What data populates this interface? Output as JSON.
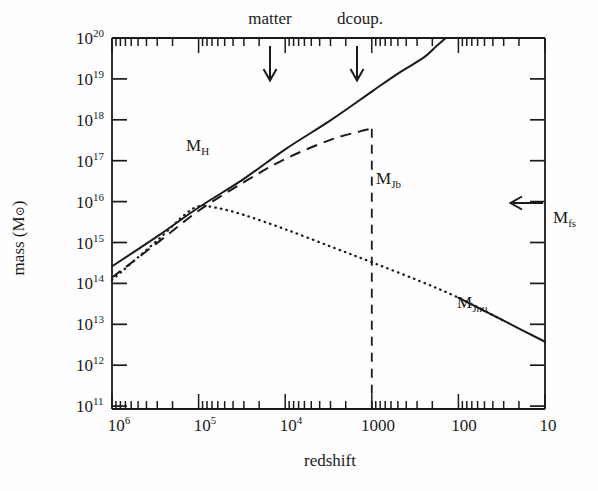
{
  "figure": {
    "kind": "log-log line plot",
    "background_color": "#fefefe",
    "ink_color": "#1a1a1a"
  },
  "chart_data": {
    "type": "line",
    "title": "",
    "xlabel": "redshift",
    "ylabel": "mass (M⊙)",
    "x_scale": "log-reversed",
    "y_scale": "log",
    "xlim": [
      1000000,
      10
    ],
    "ylim": [
      10000000000.0,
      1e+20
    ],
    "grid": false,
    "legend": "inline-annotations",
    "x_tick_labels": [
      "10⁶",
      "10⁵",
      "10⁴",
      "1000",
      "100",
      "10"
    ],
    "x_tick_values": [
      1000000,
      100000,
      10000,
      1000,
      100,
      10
    ],
    "y_tick_labels": [
      "10²⁰",
      "10¹⁹",
      "10¹⁸",
      "10¹⁷",
      "10¹⁶",
      "10¹⁵",
      "10¹⁴",
      "10¹³",
      "10¹²",
      "10¹¹"
    ],
    "y_tick_values": [
      1e+20,
      1e+19,
      1e+18,
      1e+17,
      1e+16,
      1000000000000000.0,
      100000000000000.0,
      10000000000000.0,
      1000000000000.0,
      100000000000.0
    ],
    "series": [
      {
        "name": "M_H",
        "label": "M",
        "sub": "H",
        "style": "solid",
        "description": "Horizon mass; rises monotonically toward low redshift",
        "points": [
          [
            1000000,
            70000000000000.0
          ],
          [
            300000,
            450000000000000.0
          ],
          [
            100000,
            2700000000000000.0
          ],
          [
            30000,
            1.6e+16
          ],
          [
            10000,
            1e+17
          ],
          [
            3000,
            6e+17
          ],
          [
            1000,
            3.6e+18
          ],
          [
            500,
            1.1e+19
          ],
          [
            250,
            3e+19
          ],
          [
            180,
            6e+19
          ],
          [
            140,
            1e+20
          ]
        ]
      },
      {
        "name": "M_Jb",
        "label": "M",
        "sub": "Jb",
        "style": "dashed",
        "description": "Baryon Jeans mass; tracks M_H then flattens and drops vertically at decoupling",
        "points": [
          [
            1000000,
            35000000000000.0
          ],
          [
            300000,
            300000000000000.0
          ],
          [
            100000,
            2200000000000000.0
          ],
          [
            30000,
            1.3e+16
          ],
          [
            10000,
            5.5e+16
          ],
          [
            3000,
            1.8e+17
          ],
          [
            1400,
            3e+17
          ],
          [
            1000,
            3.6e+17
          ]
        ],
        "vertical_drop_at_redshift": 1000
      },
      {
        "name": "M_Jnu",
        "label": "M",
        "sub": "Jnu",
        "style": "dotted-then-solid",
        "description": "Neutrino Jeans mass; peaks near z=1e5 at ~3e15 then declines",
        "points": [
          [
            1000000,
            30000000000000.0
          ],
          [
            300000,
            350000000000000.0
          ],
          [
            150000,
            1600000000000000.0
          ],
          [
            100000,
            2900000000000000.0
          ],
          [
            60000,
            2600000000000000.0
          ],
          [
            30000,
            1700000000000000.0
          ],
          [
            10000,
            700000000000000.0
          ],
          [
            3000,
            240000000000000.0
          ],
          [
            1000,
            90000000000000.0
          ],
          [
            300,
            30000000000000.0
          ],
          [
            100,
            10000000000000.0
          ],
          [
            30,
            2400000000000.0
          ],
          [
            10,
            650000000000.0
          ]
        ]
      }
    ],
    "annotations": [
      {
        "name": "matter",
        "text": "matter",
        "type": "top-arrow",
        "redshift": 6000
      },
      {
        "name": "dcoup",
        "text": "dcoup.",
        "type": "top-arrow",
        "redshift": 1000
      },
      {
        "name": "mfs",
        "text": "M",
        "sub": "fs",
        "type": "right-arrow",
        "mass": 4000000000000000.0
      }
    ]
  },
  "labels": {
    "x_axis_title": "redshift",
    "y_axis_title": "mass (M",
    "y_axis_title_suffix": ")",
    "y_axis_sun_symbol": "⊙",
    "top_annotation_matter": "matter",
    "top_annotation_dcoup": "dcoup.",
    "curve_MH": "M",
    "curve_MH_sub": "H",
    "curve_MJb": "M",
    "curve_MJb_sub": "Jb",
    "curve_MJnu": "M",
    "curve_MJnu_sub": "Jnu",
    "curve_Mfs": "M",
    "curve_Mfs_sub": "fs"
  },
  "ticks": {
    "y": [
      {
        "exp": "20",
        "base": "10"
      },
      {
        "exp": "19",
        "base": "10"
      },
      {
        "exp": "18",
        "base": "10"
      },
      {
        "exp": "17",
        "base": "10"
      },
      {
        "exp": "16",
        "base": "10"
      },
      {
        "exp": "15",
        "base": "10"
      },
      {
        "exp": "14",
        "base": "10"
      },
      {
        "exp": "13",
        "base": "10"
      },
      {
        "exp": "12",
        "base": "10"
      },
      {
        "exp": "11",
        "base": "10"
      }
    ],
    "x": [
      {
        "base": "10",
        "exp": "6",
        "plain": ""
      },
      {
        "base": "10",
        "exp": "5",
        "plain": ""
      },
      {
        "base": "10",
        "exp": "4",
        "plain": ""
      },
      {
        "base": "",
        "exp": "",
        "plain": "1000"
      },
      {
        "base": "",
        "exp": "",
        "plain": "100"
      },
      {
        "base": "",
        "exp": "",
        "plain": "10"
      }
    ]
  }
}
